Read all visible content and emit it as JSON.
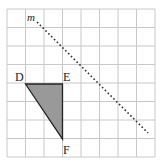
{
  "diagram": {
    "grid": {
      "cols": 8,
      "rows": 8,
      "color": "#c8c8c8"
    },
    "line_label": "m",
    "vertices": {
      "D": "D",
      "E": "E",
      "F": "F"
    },
    "triangle_fill": "#999999",
    "line_style": "dotted"
  }
}
